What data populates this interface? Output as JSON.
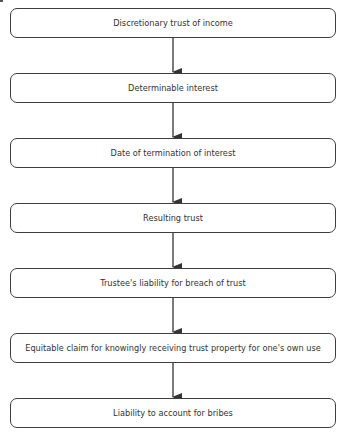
{
  "diagram": {
    "type": "flowchart",
    "direction": "top-to-bottom",
    "nodes": [
      {
        "id": "n1",
        "label": "Discretionary trust of income"
      },
      {
        "id": "n2",
        "label": "Determinable interest"
      },
      {
        "id": "n3",
        "label": "Date of termination of interest"
      },
      {
        "id": "n4",
        "label": "Resulting trust"
      },
      {
        "id": "n5",
        "label": "Trustee's liability for breach of trust"
      },
      {
        "id": "n6",
        "label": "Equitable claim for knowingly receiving trust property for one's own use"
      },
      {
        "id": "n7",
        "label": "Liability to account for bribes"
      }
    ],
    "edges": [
      {
        "from": "n1",
        "to": "n2"
      },
      {
        "from": "n2",
        "to": "n3"
      },
      {
        "from": "n3",
        "to": "n4"
      },
      {
        "from": "n4",
        "to": "n5"
      },
      {
        "from": "n5",
        "to": "n6"
      },
      {
        "from": "n6",
        "to": "n7"
      }
    ],
    "colors": {
      "border": "#3e3e3e",
      "text": "#333333",
      "arrow": "#333333",
      "background": "#ffffff"
    }
  }
}
